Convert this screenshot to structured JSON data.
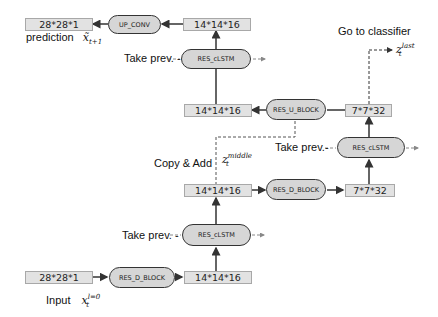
{
  "diagram": {
    "tensors": {
      "top_out": "28*28*1",
      "top_mid": "14*14*16",
      "u_out": "14*14*16",
      "u_in": "7*7*32",
      "d_in": "14*14*16",
      "d_out": "7*7*32",
      "bottom_in": "28*28*1",
      "bottom_out": "14*14*16"
    },
    "ops": {
      "up_conv": "UP_CONV",
      "lstm_top": "RES_cLSTM",
      "res_u_block": "RES_U_BLOCK",
      "lstm_right": "RES_cLSTM",
      "res_d_block_mid": "RES_D_BLOCK",
      "lstm_bottom": "RES_cLSTM",
      "res_d_block_bottom": "RES_D_BLOCK"
    },
    "labels": {
      "prediction": "prediction",
      "prediction_var": "x̃",
      "prediction_sub": "t+1",
      "take_prev_top": "Take prev. -",
      "take_prev_right": "Take prev.-",
      "take_prev_bottom": "Take prev. -",
      "go_to_classifier": "Go to classifier",
      "z_last_var": "z",
      "z_last_sup": "last",
      "z_last_sub": "t",
      "copy_add": "Copy & Add",
      "z_middle_var": "z",
      "z_middle_sup": "middle",
      "z_middle_sub": "t",
      "input": "Input",
      "input_var": "x",
      "input_sup": "l=0",
      "input_sub": "t"
    },
    "colors": {
      "tensor_fill": "#e2e2e2",
      "op_fill": "#d6d6d6",
      "line": "#333333"
    }
  }
}
